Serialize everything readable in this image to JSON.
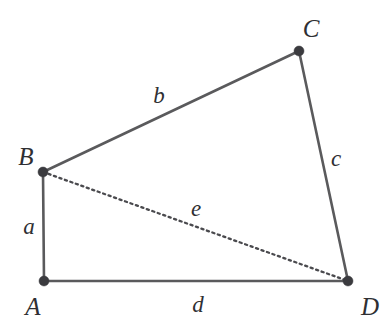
{
  "figure": {
    "background_color": "#ffffff",
    "line_color": "#5a5a5c",
    "dash_color": "#4a4a4e",
    "vertex_color": "#3b3b3f",
    "label_color": "#2f2f33",
    "width": 388,
    "height": 333
  },
  "vertices": [
    {
      "id": "A",
      "label": "A",
      "x": 44,
      "y": 281,
      "label_x": 33,
      "label_y": 306
    },
    {
      "id": "B",
      "label": "B",
      "x": 43,
      "y": 172,
      "label_x": 26,
      "label_y": 156
    },
    {
      "id": "C",
      "label": "C",
      "x": 299,
      "y": 51,
      "label_x": 311,
      "label_y": 28
    },
    {
      "id": "D",
      "label": "D",
      "x": 348,
      "y": 281,
      "label_x": 370,
      "label_y": 306
    }
  ],
  "edges": [
    {
      "id": "a",
      "label": "a",
      "from": "A",
      "to": "B",
      "style": "solid",
      "label_x": 29,
      "label_y": 226
    },
    {
      "id": "b",
      "label": "b",
      "from": "B",
      "to": "C",
      "style": "solid",
      "label_x": 159,
      "label_y": 95
    },
    {
      "id": "c",
      "label": "c",
      "from": "C",
      "to": "D",
      "style": "solid",
      "label_x": 336,
      "label_y": 158
    },
    {
      "id": "d",
      "label": "d",
      "from": "A",
      "to": "D",
      "style": "solid",
      "label_x": 198,
      "label_y": 304
    },
    {
      "id": "e",
      "label": "e",
      "from": "B",
      "to": "D",
      "style": "dashed",
      "label_x": 196,
      "label_y": 208
    }
  ]
}
